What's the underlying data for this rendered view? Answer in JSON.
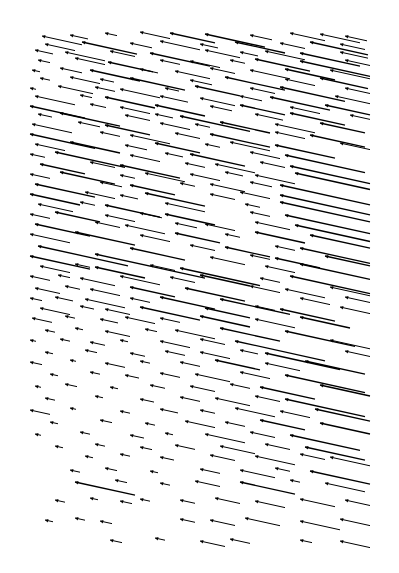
{
  "chart_data": {
    "type": "quiver",
    "title": "",
    "xlabel": "",
    "ylabel": "",
    "axes_visible": false,
    "grid": false,
    "legend": null,
    "plot_area": {
      "x0": 28,
      "y0": 30,
      "x1": 372,
      "y1": 542
    },
    "arrow_color": "#000000",
    "background": "#ffffff",
    "direction": "heads point left (toward upper-left), shafts slope down-right",
    "slope": 0.22,
    "arrows": [
      [
        42,
        36,
        40
      ],
      [
        70,
        35,
        18
      ],
      [
        105,
        33,
        12
      ],
      [
        140,
        32,
        30
      ],
      [
        170,
        33,
        45
      ],
      [
        205,
        34,
        60
      ],
      [
        250,
        35,
        22
      ],
      [
        290,
        33,
        35
      ],
      [
        320,
        34,
        40
      ],
      [
        345,
        36,
        22
      ],
      [
        45,
        44,
        30
      ],
      [
        82,
        42,
        55
      ],
      [
        130,
        43,
        22
      ],
      [
        160,
        41,
        40
      ],
      [
        200,
        44,
        18
      ],
      [
        235,
        42,
        50
      ],
      [
        280,
        43,
        25
      ],
      [
        310,
        42,
        58
      ],
      [
        340,
        44,
        25
      ],
      [
        35,
        50,
        18
      ],
      [
        65,
        52,
        40
      ],
      [
        110,
        51,
        25
      ],
      [
        150,
        53,
        60
      ],
      [
        205,
        50,
        35
      ],
      [
        240,
        52,
        18
      ],
      [
        265,
        51,
        40
      ],
      [
        300,
        53,
        60
      ],
      [
        340,
        52,
        28
      ],
      [
        38,
        60,
        12
      ],
      [
        75,
        58,
        30
      ],
      [
        108,
        62,
        45
      ],
      [
        160,
        60,
        20
      ],
      [
        190,
        61,
        30
      ],
      [
        230,
        60,
        15
      ],
      [
        255,
        59,
        55
      ],
      [
        300,
        61,
        70
      ],
      [
        345,
        60,
        25
      ],
      [
        32,
        70,
        8
      ],
      [
        60,
        68,
        22
      ],
      [
        90,
        70,
        50
      ],
      [
        140,
        69,
        18
      ],
      [
        175,
        71,
        35
      ],
      [
        210,
        68,
        25
      ],
      [
        250,
        70,
        40
      ],
      [
        285,
        69,
        50
      ],
      [
        330,
        70,
        40
      ],
      [
        40,
        78,
        10
      ],
      [
        70,
        77,
        30
      ],
      [
        100,
        79,
        14
      ],
      [
        130,
        78,
        55
      ],
      [
        190,
        80,
        22
      ],
      [
        225,
        77,
        60
      ],
      [
        285,
        79,
        30
      ],
      [
        320,
        78,
        48
      ],
      [
        30,
        88,
        6
      ],
      [
        58,
        86,
        35
      ],
      [
        95,
        87,
        20
      ],
      [
        120,
        89,
        40
      ],
      [
        165,
        88,
        14
      ],
      [
        195,
        86,
        45
      ],
      [
        250,
        88,
        25
      ],
      [
        280,
        87,
        65
      ],
      [
        345,
        88,
        25
      ],
      [
        35,
        96,
        40
      ],
      [
        80,
        95,
        12
      ],
      [
        105,
        97,
        50
      ],
      [
        160,
        96,
        28
      ],
      [
        200,
        98,
        35
      ],
      [
        240,
        96,
        22
      ],
      [
        270,
        97,
        60
      ],
      [
        335,
        96,
        35
      ],
      [
        30,
        106,
        55
      ],
      [
        90,
        104,
        16
      ],
      [
        120,
        107,
        30
      ],
      [
        155,
        105,
        50
      ],
      [
        210,
        106,
        22
      ],
      [
        240,
        105,
        45
      ],
      [
        290,
        107,
        30
      ],
      [
        325,
        105,
        45
      ],
      [
        38,
        114,
        14
      ],
      [
        60,
        113,
        60
      ],
      [
        125,
        115,
        25
      ],
      [
        155,
        114,
        18
      ],
      [
        180,
        116,
        70
      ],
      [
        255,
        114,
        28
      ],
      [
        290,
        113,
        55
      ],
      [
        350,
        115,
        20
      ],
      [
        32,
        124,
        40
      ],
      [
        78,
        122,
        22
      ],
      [
        105,
        125,
        45
      ],
      [
        160,
        123,
        30
      ],
      [
        195,
        124,
        15
      ],
      [
        220,
        122,
        50
      ],
      [
        275,
        124,
        40
      ],
      [
        320,
        123,
        45
      ],
      [
        30,
        134,
        65
      ],
      [
        100,
        132,
        20
      ],
      [
        130,
        135,
        40
      ],
      [
        175,
        133,
        25
      ],
      [
        210,
        134,
        60
      ],
      [
        275,
        132,
        30
      ],
      [
        310,
        135,
        55
      ],
      [
        35,
        144,
        30
      ],
      [
        70,
        142,
        50
      ],
      [
        125,
        145,
        22
      ],
      [
        155,
        143,
        45
      ],
      [
        205,
        144,
        15
      ],
      [
        230,
        142,
        40
      ],
      [
        275,
        145,
        60
      ],
      [
        340,
        143,
        30
      ],
      [
        30,
        154,
        15
      ],
      [
        55,
        152,
        70
      ],
      [
        130,
        155,
        30
      ],
      [
        165,
        153,
        18
      ],
      [
        190,
        154,
        55
      ],
      [
        250,
        152,
        30
      ],
      [
        285,
        155,
        80
      ],
      [
        40,
        164,
        45
      ],
      [
        90,
        162,
        25
      ],
      [
        120,
        165,
        60
      ],
      [
        185,
        163,
        20
      ],
      [
        215,
        164,
        40
      ],
      [
        260,
        162,
        25
      ],
      [
        290,
        166,
        80
      ],
      [
        30,
        174,
        20
      ],
      [
        60,
        172,
        55
      ],
      [
        120,
        175,
        15
      ],
      [
        145,
        173,
        40
      ],
      [
        190,
        174,
        30
      ],
      [
        225,
        172,
        18
      ],
      [
        255,
        175,
        40
      ],
      [
        295,
        173,
        75
      ],
      [
        35,
        184,
        60
      ],
      [
        100,
        182,
        22
      ],
      [
        130,
        185,
        45
      ],
      [
        180,
        183,
        15
      ],
      [
        210,
        184,
        35
      ],
      [
        250,
        182,
        22
      ],
      [
        280,
        185,
        90
      ],
      [
        30,
        194,
        50
      ],
      [
        85,
        192,
        30
      ],
      [
        120,
        195,
        18
      ],
      [
        145,
        193,
        60
      ],
      [
        210,
        194,
        25
      ],
      [
        240,
        192,
        30
      ],
      [
        280,
        195,
        90
      ],
      [
        38,
        204,
        35
      ],
      [
        80,
        202,
        15
      ],
      [
        105,
        205,
        55
      ],
      [
        165,
        203,
        40
      ],
      [
        245,
        204,
        15
      ],
      [
        280,
        202,
        90
      ],
      [
        30,
        214,
        20
      ],
      [
        55,
        212,
        45
      ],
      [
        105,
        215,
        30
      ],
      [
        140,
        213,
        22
      ],
      [
        165,
        214,
        50
      ],
      [
        250,
        212,
        20
      ],
      [
        285,
        215,
        85
      ],
      [
        35,
        224,
        55
      ],
      [
        95,
        222,
        25
      ],
      [
        125,
        225,
        40
      ],
      [
        175,
        223,
        22
      ],
      [
        205,
        224,
        30
      ],
      [
        255,
        222,
        35
      ],
      [
        295,
        225,
        75
      ],
      [
        30,
        234,
        40
      ],
      [
        75,
        232,
        60
      ],
      [
        140,
        235,
        30
      ],
      [
        175,
        233,
        45
      ],
      [
        225,
        234,
        15
      ],
      [
        255,
        232,
        50
      ],
      [
        310,
        235,
        60
      ],
      [
        38,
        246,
        90
      ],
      [
        130,
        248,
        55
      ],
      [
        190,
        245,
        25
      ],
      [
        225,
        247,
        45
      ],
      [
        275,
        246,
        20
      ],
      [
        300,
        248,
        70
      ],
      [
        30,
        256,
        60
      ],
      [
        95,
        254,
        110
      ],
      [
        210,
        257,
        35
      ],
      [
        250,
        255,
        20
      ],
      [
        275,
        258,
        45
      ],
      [
        325,
        256,
        45
      ],
      [
        40,
        266,
        30
      ],
      [
        75,
        264,
        15
      ],
      [
        95,
        267,
        50
      ],
      [
        150,
        265,
        25
      ],
      [
        180,
        268,
        80
      ],
      [
        265,
        266,
        30
      ],
      [
        300,
        264,
        70
      ],
      [
        30,
        276,
        20
      ],
      [
        58,
        275,
        12
      ],
      [
        80,
        278,
        35
      ],
      [
        120,
        276,
        40
      ],
      [
        170,
        277,
        25
      ],
      [
        200,
        275,
        50
      ],
      [
        260,
        278,
        20
      ],
      [
        290,
        276,
        80
      ],
      [
        35,
        288,
        25
      ],
      [
        65,
        286,
        15
      ],
      [
        90,
        289,
        30
      ],
      [
        130,
        287,
        45
      ],
      [
        185,
        288,
        60
      ],
      [
        250,
        286,
        30
      ],
      [
        285,
        289,
        40
      ],
      [
        330,
        287,
        40
      ],
      [
        30,
        298,
        12
      ],
      [
        55,
        297,
        18
      ],
      [
        85,
        299,
        40
      ],
      [
        130,
        298,
        20
      ],
      [
        160,
        297,
        55
      ],
      [
        220,
        299,
        70
      ],
      [
        300,
        298,
        30
      ],
      [
        345,
        297,
        25
      ],
      [
        40,
        308,
        30
      ],
      [
        80,
        306,
        14
      ],
      [
        105,
        309,
        25
      ],
      [
        140,
        307,
        60
      ],
      [
        205,
        308,
        45
      ],
      [
        255,
        306,
        20
      ],
      [
        280,
        309,
        55
      ],
      [
        340,
        307,
        30
      ],
      [
        32,
        318,
        20
      ],
      [
        65,
        316,
        10
      ],
      [
        100,
        319,
        18
      ],
      [
        125,
        317,
        30
      ],
      [
        160,
        318,
        20
      ],
      [
        200,
        316,
        50
      ],
      [
        255,
        319,
        40
      ],
      [
        300,
        317,
        50
      ],
      [
        45,
        330,
        10
      ],
      [
        75,
        328,
        8
      ],
      [
        105,
        331,
        25
      ],
      [
        145,
        329,
        12
      ],
      [
        175,
        330,
        40
      ],
      [
        220,
        328,
        60
      ],
      [
        285,
        331,
        70
      ],
      [
        30,
        340,
        6
      ],
      [
        60,
        339,
        10
      ],
      [
        90,
        342,
        15
      ],
      [
        120,
        340,
        8
      ],
      [
        160,
        341,
        30
      ],
      [
        200,
        339,
        25
      ],
      [
        235,
        341,
        90
      ],
      [
        330,
        340,
        40
      ],
      [
        45,
        352,
        8
      ],
      [
        85,
        350,
        12
      ],
      [
        130,
        353,
        15
      ],
      [
        165,
        351,
        20
      ],
      [
        200,
        352,
        30
      ],
      [
        240,
        350,
        18
      ],
      [
        265,
        353,
        75
      ],
      [
        345,
        351,
        25
      ],
      [
        30,
        362,
        12
      ],
      [
        70,
        360,
        6
      ],
      [
        105,
        363,
        20
      ],
      [
        140,
        361,
        10
      ],
      [
        180,
        362,
        20
      ],
      [
        215,
        360,
        45
      ],
      [
        265,
        363,
        35
      ],
      [
        305,
        361,
        60
      ],
      [
        50,
        374,
        8
      ],
      [
        90,
        372,
        10
      ],
      [
        125,
        375,
        14
      ],
      [
        160,
        373,
        20
      ],
      [
        195,
        374,
        35
      ],
      [
        240,
        372,
        30
      ],
      [
        285,
        375,
        80
      ],
      [
        35,
        386,
        6
      ],
      [
        65,
        384,
        12
      ],
      [
        110,
        387,
        8
      ],
      [
        150,
        385,
        15
      ],
      [
        190,
        386,
        25
      ],
      [
        230,
        384,
        20
      ],
      [
        260,
        387,
        55
      ],
      [
        320,
        385,
        50
      ],
      [
        45,
        398,
        10
      ],
      [
        95,
        396,
        8
      ],
      [
        140,
        399,
        14
      ],
      [
        180,
        397,
        20
      ],
      [
        215,
        398,
        35
      ],
      [
        255,
        396,
        25
      ],
      [
        285,
        399,
        80
      ],
      [
        30,
        410,
        20
      ],
      [
        70,
        408,
        6
      ],
      [
        120,
        411,
        10
      ],
      [
        160,
        409,
        18
      ],
      [
        200,
        410,
        15
      ],
      [
        235,
        408,
        40
      ],
      [
        280,
        411,
        30
      ],
      [
        315,
        409,
        55
      ],
      [
        50,
        422,
        8
      ],
      [
        100,
        420,
        12
      ],
      [
        145,
        423,
        10
      ],
      [
        185,
        421,
        30
      ],
      [
        225,
        422,
        20
      ],
      [
        260,
        420,
        45
      ],
      [
        320,
        423,
        50
      ],
      [
        35,
        434,
        6
      ],
      [
        80,
        432,
        10
      ],
      [
        130,
        435,
        14
      ],
      [
        165,
        433,
        8
      ],
      [
        205,
        434,
        40
      ],
      [
        250,
        432,
        25
      ],
      [
        290,
        435,
        70
      ],
      [
        55,
        446,
        8
      ],
      [
        95,
        444,
        10
      ],
      [
        140,
        447,
        12
      ],
      [
        175,
        445,
        20
      ],
      [
        220,
        446,
        35
      ],
      [
        265,
        444,
        25
      ],
      [
        305,
        447,
        60
      ],
      [
        85,
        456,
        8
      ],
      [
        120,
        454,
        10
      ],
      [
        160,
        457,
        14
      ],
      [
        210,
        455,
        25
      ],
      [
        255,
        456,
        40
      ],
      [
        300,
        454,
        25
      ],
      [
        330,
        457,
        40
      ],
      [
        70,
        470,
        10
      ],
      [
        105,
        468,
        12
      ],
      [
        150,
        471,
        8
      ],
      [
        200,
        469,
        20
      ],
      [
        240,
        470,
        35
      ],
      [
        275,
        468,
        15
      ],
      [
        310,
        471,
        60
      ],
      [
        75,
        482,
        60
      ],
      [
        115,
        480,
        12
      ],
      [
        160,
        483,
        10
      ],
      [
        195,
        481,
        25
      ],
      [
        240,
        482,
        55
      ],
      [
        290,
        480,
        10
      ],
      [
        325,
        483,
        40
      ],
      [
        55,
        500,
        10
      ],
      [
        90,
        498,
        8
      ],
      [
        120,
        501,
        12
      ],
      [
        140,
        499,
        10
      ],
      [
        180,
        500,
        15
      ],
      [
        215,
        498,
        25
      ],
      [
        255,
        501,
        30
      ],
      [
        300,
        499,
        35
      ],
      [
        345,
        500,
        25
      ],
      [
        45,
        520,
        8
      ],
      [
        75,
        518,
        10
      ],
      [
        100,
        521,
        12
      ],
      [
        180,
        519,
        15
      ],
      [
        210,
        520,
        25
      ],
      [
        245,
        518,
        35
      ],
      [
        300,
        521,
        40
      ],
      [
        340,
        519,
        30
      ],
      [
        110,
        540,
        12
      ],
      [
        155,
        538,
        10
      ],
      [
        200,
        541,
        25
      ],
      [
        230,
        539,
        20
      ],
      [
        300,
        540,
        12
      ],
      [
        340,
        541,
        30
      ]
    ]
  }
}
